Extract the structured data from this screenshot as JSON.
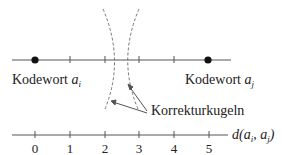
{
  "diagram": {
    "codeword_left": {
      "label": "Kodewort",
      "symbol": "a",
      "subscript": "i"
    },
    "codeword_right": {
      "label": "Kodewort",
      "symbol": "a",
      "subscript": "j"
    },
    "correction_spheres_label": "Korrekturkugeln",
    "axis": {
      "label_func": "d(",
      "label_a1": "a",
      "label_s1": "i",
      "label_sep": ", ",
      "label_a2": "a",
      "label_s2": "j",
      "label_close": ")",
      "ticks": [
        "0",
        "1",
        "2",
        "3",
        "4",
        "5"
      ]
    },
    "colors": {
      "line": "#555555",
      "dash": "#777777",
      "dot": "#111111"
    }
  }
}
